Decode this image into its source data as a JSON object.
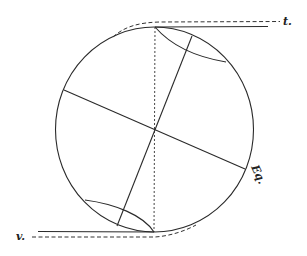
{
  "figure": {
    "labels": {
      "t": "t.",
      "v": "v.",
      "eq": "Eq."
    },
    "colors": {
      "ink": "#2a2a2a",
      "background": "#ffffff"
    }
  }
}
